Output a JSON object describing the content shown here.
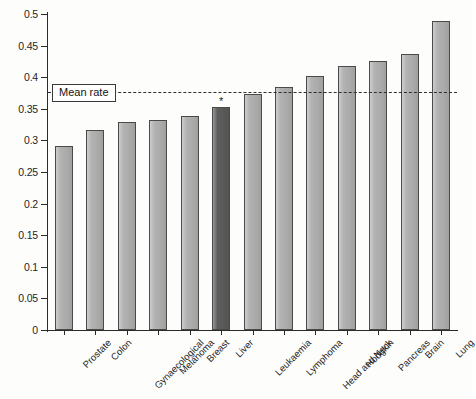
{
  "chart_data": {
    "type": "bar",
    "title": "",
    "xlabel": "",
    "ylabel": "",
    "ylim": [
      0,
      0.5
    ],
    "grid": false,
    "legend": "none",
    "categories": [
      "Prostate",
      "Colon",
      "Gynaecological",
      "Melanoma",
      "Breast",
      "Liver",
      "Leukaemia",
      "Lymphoma",
      "Head and Neck",
      "Hodgkin",
      "Pancreas",
      "Brain",
      "Lung"
    ],
    "values": [
      0.291,
      0.317,
      0.329,
      0.333,
      0.339,
      0.353,
      0.374,
      0.384,
      0.402,
      0.418,
      0.425,
      0.437,
      0.489
    ],
    "ytick_labels": [
      "0",
      "0.05",
      "0.1",
      "0.15",
      "0.2",
      "0.25",
      "0.3",
      "0.35",
      "0.4",
      "0.45",
      "0.5"
    ],
    "ytick_values": [
      0,
      0.05,
      0.1,
      0.15,
      0.2,
      0.25,
      0.3,
      0.35,
      0.4,
      0.45,
      0.5
    ],
    "annotations": [
      {
        "name": "mean-rate-line",
        "label": "Mean rate",
        "value": 0.377,
        "style": "dashed-horizontal-line"
      },
      {
        "name": "significance-marker",
        "label": "*",
        "category": "Liver"
      }
    ],
    "highlight_category": "Liver",
    "colors": {
      "bar": "#b2b2b2",
      "bar_highlight": "#5d5d5d",
      "bar_border": "#4a4a4a",
      "axis": "#2b2b2b",
      "mean_line": "#2f2f2f",
      "background": "#fdfdfc",
      "text": "#1f1f1f"
    }
  }
}
